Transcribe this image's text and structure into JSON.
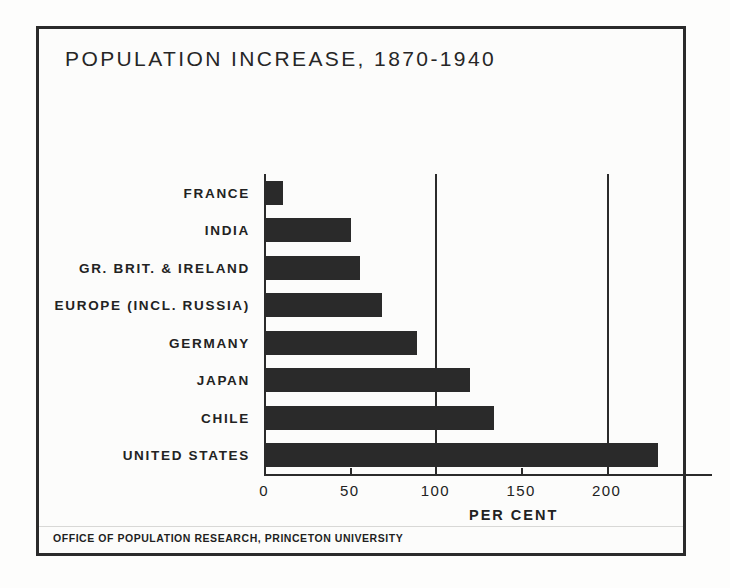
{
  "chart_data": {
    "type": "bar",
    "orientation": "horizontal",
    "title": "POPULATION INCREASE, 1870-1940",
    "xlabel": "PER CENT",
    "ylabel": "",
    "categories": [
      "FRANCE",
      "INDIA",
      "GR. BRIT. & IRELAND",
      "EUROPE (INCL. RUSSIA)",
      "GERMANY",
      "JAPAN",
      "CHILE",
      "UNITED STATES"
    ],
    "values": [
      11,
      51,
      56,
      69,
      89,
      120,
      134,
      230
    ],
    "xlim": [
      0,
      248
    ],
    "xticks": [
      0,
      50,
      100,
      150,
      200
    ],
    "xticklabels": [
      "0",
      "50",
      "100",
      "150",
      "200"
    ],
    "gridlines_at": [
      100,
      200
    ],
    "grid": true,
    "legend": null,
    "bar_color": "#2a2a2a",
    "axis_color": "#2b2b2b",
    "background_color": "#fcfcfb"
  },
  "footer": {
    "credit": "OFFICE OF POPULATION RESEARCH, PRINCETON UNIVERSITY"
  }
}
